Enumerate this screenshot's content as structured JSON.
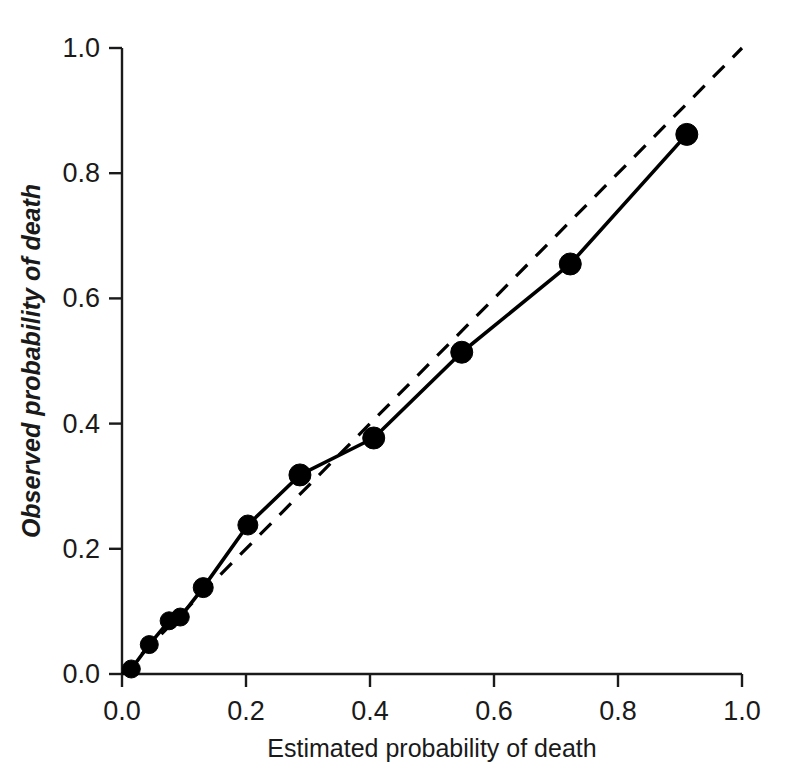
{
  "chart_data": {
    "type": "line",
    "title": "",
    "xlabel": "Estimated probability of death",
    "ylabel": "Observed probability of death",
    "xlim": [
      0.0,
      1.0
    ],
    "ylim": [
      0.0,
      1.0
    ],
    "grid": false,
    "legend": "none",
    "x_ticks": [
      "0.0",
      "0.2",
      "0.4",
      "0.6",
      "0.8",
      "1.0"
    ],
    "y_ticks": [
      "0.0",
      "0.2",
      "0.4",
      "0.6",
      "0.8",
      "1.0"
    ],
    "x_tick_values": [
      0.0,
      0.2,
      0.4,
      0.6,
      0.8,
      1.0
    ],
    "y_tick_values": [
      0.0,
      0.2,
      0.4,
      0.6,
      0.8,
      1.0
    ],
    "series": [
      {
        "name": "Observed vs estimated",
        "style": "solid-with-markers",
        "marker": "filled-circle",
        "color": "#000000",
        "x": [
          0.015,
          0.044,
          0.076,
          0.094,
          0.131,
          0.203,
          0.287,
          0.406,
          0.548,
          0.723,
          0.911
        ],
        "y": [
          0.008,
          0.047,
          0.085,
          0.091,
          0.138,
          0.238,
          0.318,
          0.377,
          0.514,
          0.655,
          0.862
        ]
      },
      {
        "name": "Reference line (perfect calibration)",
        "style": "dashed",
        "marker": "none",
        "color": "#000000",
        "x": [
          0.0,
          1.0
        ],
        "y": [
          0.0,
          1.0
        ]
      }
    ]
  },
  "axes": {
    "x_axis_name": "x-axis",
    "y_axis_name": "y-axis"
  }
}
